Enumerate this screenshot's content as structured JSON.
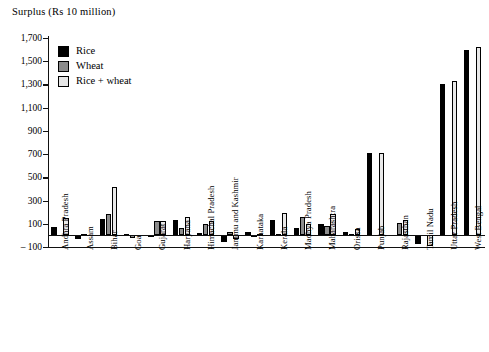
{
  "chart_data": {
    "type": "bar",
    "title": "Surplus (Rs 10 million)",
    "xlabel": "",
    "ylabel": "Surplus (Rs 10 million)",
    "ylim": [
      -100,
      1700
    ],
    "yticks": [
      -100,
      100,
      300,
      500,
      700,
      900,
      1100,
      1300,
      1500,
      1700
    ],
    "ytick_labels": [
      "– 100",
      "100",
      "300",
      "500",
      "700",
      "900",
      "1,100",
      "1,300",
      "1,500",
      "1,700"
    ],
    "grid": false,
    "legend_position": "top-left",
    "legend": [
      "Rice",
      "Wheat",
      "Rice + wheat"
    ],
    "categories": [
      "Andhra Pradesh",
      "Assam",
      "Bihar",
      "Goa",
      "Gujarat",
      "Haryana",
      "Himachal Pradesh",
      "Jammu and Kashmir",
      "Karnataka",
      "Kerala",
      "Madhya Pradesh",
      "Maharashtra",
      "Orissa",
      "Punjab",
      "Rajasthan",
      "Tamil Nadu",
      "Uttar Pradesh",
      "West Bengal"
    ],
    "series": [
      {
        "name": "Rice",
        "color": "#000000",
        "values": [
          75,
          -35,
          140,
          10,
          5,
          130,
          20,
          -60,
          25,
          130,
          65,
          95,
          30,
          710,
          0,
          -70,
          1300,
          1600
        ]
      },
      {
        "name": "Wheat",
        "color": "#8c8c8c",
        "values": [
          0,
          15,
          180,
          -20,
          120,
          60,
          100,
          25,
          -15,
          10,
          155,
          80,
          15,
          0,
          110,
          0,
          0,
          0
        ]
      },
      {
        "name": "Rice + wheat",
        "color": "#e9e9e9",
        "values": [
          150,
          0,
          420,
          0,
          125,
          160,
          120,
          -30,
          10,
          190,
          100,
          180,
          55,
          710,
          130,
          -90,
          1330,
          1620
        ]
      }
    ]
  }
}
